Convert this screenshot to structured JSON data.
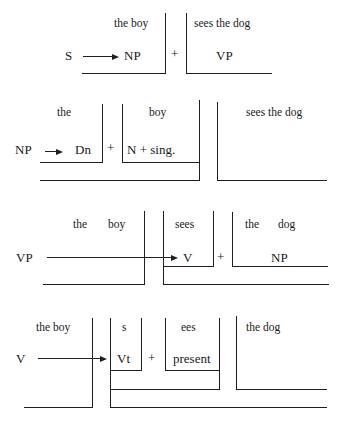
{
  "rows": [
    {
      "id": "row-1",
      "rule": "S → NP + VP",
      "labels": [
        {
          "name": "words-the-boy",
          "text": "the boy",
          "x": 114,
          "y": 18,
          "size": "small"
        },
        {
          "name": "words-sees-the-dog",
          "text": "sees the dog",
          "x": 194,
          "y": 18,
          "size": "small"
        },
        {
          "name": "symbol-s",
          "text": "S",
          "x": 65,
          "y": 49,
          "size": "big"
        },
        {
          "name": "symbol-np",
          "text": "NP",
          "x": 124,
          "y": 49,
          "size": "big"
        },
        {
          "name": "plus-sign",
          "text": "+",
          "x": 171,
          "y": 47,
          "size": "big"
        },
        {
          "name": "symbol-vp",
          "text": "VP",
          "x": 216,
          "y": 49,
          "size": "big"
        }
      ],
      "arrows": [
        {
          "x1": 83,
          "x2": 119,
          "y": 56
        }
      ],
      "hlines": [
        {
          "x1": 82,
          "x2": 166,
          "y": 73
        },
        {
          "x1": 187,
          "x2": 272,
          "y": 73
        }
      ],
      "vlines": [
        {
          "x": 165,
          "y1": 13,
          "y2": 74
        },
        {
          "x": 186,
          "y1": 13,
          "y2": 74
        }
      ]
    },
    {
      "id": "row-2",
      "rule": "NP → Dn + N + sing.",
      "labels": [
        {
          "name": "words-the",
          "text": "the",
          "x": 57,
          "y": 107,
          "size": "small"
        },
        {
          "name": "words-boy",
          "text": "boy",
          "x": 149,
          "y": 107,
          "size": "small"
        },
        {
          "name": "words-sees-the-dog",
          "text": "sees the dog",
          "x": 246,
          "y": 107,
          "size": "small"
        },
        {
          "name": "symbol-np",
          "text": "NP",
          "x": 15,
          "y": 143,
          "size": "big"
        },
        {
          "name": "symbol-dn",
          "text": "Dn",
          "x": 75,
          "y": 143,
          "size": "big"
        },
        {
          "name": "plus-sign",
          "text": "+",
          "x": 107,
          "y": 141,
          "size": "big"
        },
        {
          "name": "symbol-n-sing",
          "text": "N + sing.",
          "x": 127,
          "y": 143,
          "size": "big"
        }
      ],
      "arrows": [
        {
          "x1": 45,
          "x2": 63,
          "y": 151
        }
      ],
      "hlines": [
        {
          "x1": 40,
          "x2": 103,
          "y": 162
        },
        {
          "x1": 122,
          "x2": 199,
          "y": 162
        },
        {
          "x1": 40,
          "x2": 200,
          "y": 180
        },
        {
          "x1": 217,
          "x2": 327,
          "y": 180
        }
      ],
      "vlines": [
        {
          "x": 102,
          "y1": 104,
          "y2": 163
        },
        {
          "x": 122,
          "y1": 104,
          "y2": 163
        },
        {
          "x": 199,
          "y1": 100,
          "y2": 181
        },
        {
          "x": 217,
          "y1": 102,
          "y2": 181
        }
      ]
    },
    {
      "id": "row-3",
      "rule": "VP → V + NP",
      "labels": [
        {
          "name": "words-the",
          "text": "the",
          "x": 73,
          "y": 219,
          "size": "small"
        },
        {
          "name": "words-boy",
          "text": "boy",
          "x": 108,
          "y": 219,
          "size": "small"
        },
        {
          "name": "words-sees",
          "text": "sees",
          "x": 175,
          "y": 219,
          "size": "small"
        },
        {
          "name": "words-the",
          "text": "the",
          "x": 245,
          "y": 219,
          "size": "small"
        },
        {
          "name": "words-dog",
          "text": "dog",
          "x": 278,
          "y": 219,
          "size": "small"
        },
        {
          "name": "symbol-vp",
          "text": "VP",
          "x": 16,
          "y": 251,
          "size": "big"
        },
        {
          "name": "symbol-v",
          "text": "V",
          "x": 183,
          "y": 251,
          "size": "big"
        },
        {
          "name": "plus-sign",
          "text": "+",
          "x": 217,
          "y": 250,
          "size": "big"
        },
        {
          "name": "symbol-np",
          "text": "NP",
          "x": 271,
          "y": 251,
          "size": "big"
        }
      ],
      "arrows": [
        {
          "x1": 47,
          "x2": 178,
          "y": 257
        }
      ],
      "hlines": [
        {
          "x1": 43,
          "x2": 145,
          "y": 284
        },
        {
          "x1": 163,
          "x2": 214,
          "y": 266
        },
        {
          "x1": 232,
          "x2": 328,
          "y": 266
        },
        {
          "x1": 163,
          "x2": 329,
          "y": 284
        }
      ],
      "vlines": [
        {
          "x": 144,
          "y1": 211,
          "y2": 285
        },
        {
          "x": 163,
          "y1": 211,
          "y2": 285
        },
        {
          "x": 213,
          "y1": 211,
          "y2": 267
        },
        {
          "x": 232,
          "y1": 212,
          "y2": 267
        }
      ]
    },
    {
      "id": "row-4",
      "rule": "V → Vt + present",
      "labels": [
        {
          "name": "words-the-boy",
          "text": "the boy",
          "x": 36,
          "y": 322,
          "size": "small"
        },
        {
          "name": "words-s",
          "text": "s",
          "x": 122,
          "y": 322,
          "size": "small"
        },
        {
          "name": "words-ees",
          "text": "ees",
          "x": 181,
          "y": 322,
          "size": "small"
        },
        {
          "name": "words-the-dog",
          "text": "the dog",
          "x": 246,
          "y": 322,
          "size": "small"
        },
        {
          "name": "symbol-v",
          "text": "V",
          "x": 16,
          "y": 352,
          "size": "big"
        },
        {
          "name": "symbol-vt",
          "text": "Vt",
          "x": 117,
          "y": 352,
          "size": "big"
        },
        {
          "name": "plus-sign",
          "text": "+",
          "x": 148,
          "y": 351,
          "size": "big"
        },
        {
          "name": "symbol-present",
          "text": "present",
          "x": 173,
          "y": 352,
          "size": "big"
        }
      ],
      "arrows": [
        {
          "x1": 38,
          "x2": 107,
          "y": 358
        }
      ],
      "hlines": [
        {
          "x1": 24,
          "x2": 93,
          "y": 407
        },
        {
          "x1": 110,
          "x2": 142,
          "y": 370
        },
        {
          "x1": 165,
          "x2": 220,
          "y": 370
        },
        {
          "x1": 110,
          "x2": 220,
          "y": 389
        },
        {
          "x1": 236,
          "x2": 327,
          "y": 389
        },
        {
          "x1": 110,
          "x2": 327,
          "y": 407
        }
      ],
      "vlines": [
        {
          "x": 92,
          "y1": 318,
          "y2": 408
        },
        {
          "x": 110,
          "y1": 318,
          "y2": 408
        },
        {
          "x": 141,
          "y1": 318,
          "y2": 371
        },
        {
          "x": 165,
          "y1": 318,
          "y2": 371
        },
        {
          "x": 219,
          "y1": 318,
          "y2": 390
        },
        {
          "x": 236,
          "y1": 316,
          "y2": 390
        }
      ]
    }
  ]
}
